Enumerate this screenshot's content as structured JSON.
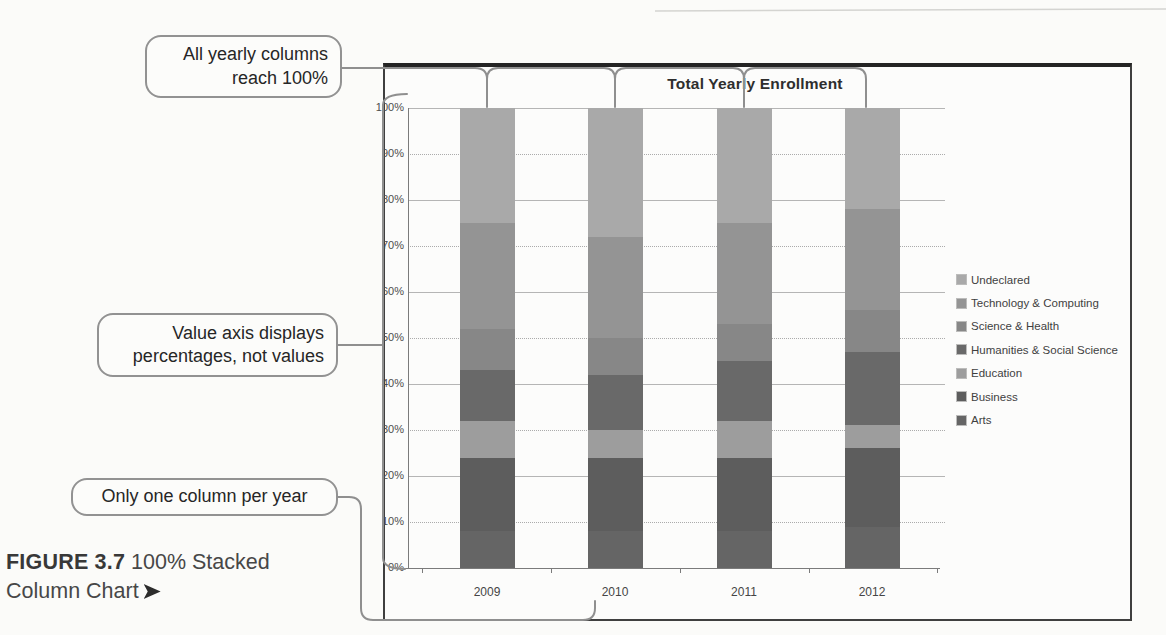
{
  "figure": {
    "caption_bold": "FIGURE 3.7",
    "caption_line1_rest": " 100% Stacked",
    "caption_line2": "Column Chart",
    "caption_arrow": "➤"
  },
  "callouts": [
    {
      "id": "all-columns-reach-100",
      "lines": [
        "All yearly columns",
        "reach 100%"
      ]
    },
    {
      "id": "value-axis-percentages",
      "lines": [
        "Value axis displays",
        "percentages, not values"
      ]
    },
    {
      "id": "one-column-per-year",
      "lines": [
        "Only one column per year"
      ]
    }
  ],
  "chart_data": {
    "type": "bar",
    "subtype": "100%-stacked-column",
    "title": "Total Yearly Enrollment",
    "categories": [
      "2009",
      "2010",
      "2011",
      "2012"
    ],
    "stack_order": "bottom-to-top",
    "series": [
      {
        "name": "Arts",
        "color": "#656565",
        "values": [
          8,
          8,
          8,
          9
        ]
      },
      {
        "name": "Business",
        "color": "#5d5d5d",
        "values": [
          16,
          16,
          16,
          17
        ]
      },
      {
        "name": "Education",
        "color": "#9d9d9d",
        "values": [
          8,
          6,
          8,
          5
        ]
      },
      {
        "name": "Humanities & Social Science",
        "color": "#696969",
        "values": [
          11,
          12,
          13,
          16
        ]
      },
      {
        "name": "Science & Health",
        "color": "#878787",
        "values": [
          9,
          8,
          8,
          9
        ]
      },
      {
        "name": "Technology & Computing",
        "color": "#949494",
        "values": [
          23,
          22,
          22,
          22
        ]
      },
      {
        "name": "Undeclared",
        "color": "#a9a9a9",
        "values": [
          25,
          28,
          25,
          22
        ]
      }
    ],
    "legend_order_top_to_bottom": [
      "Undeclared",
      "Technology & Computing",
      "Science & Health",
      "Humanities & Social Science",
      "Education",
      "Business",
      "Arts"
    ],
    "y_axis_labels": [
      "100%",
      "90%",
      "80%",
      "70%",
      "60%",
      "50%",
      "40%",
      "30%",
      "20%",
      "10%",
      "0%"
    ],
    "ylim": [
      0,
      100
    ],
    "units": "percent",
    "grid": true,
    "legend_position": "right"
  }
}
